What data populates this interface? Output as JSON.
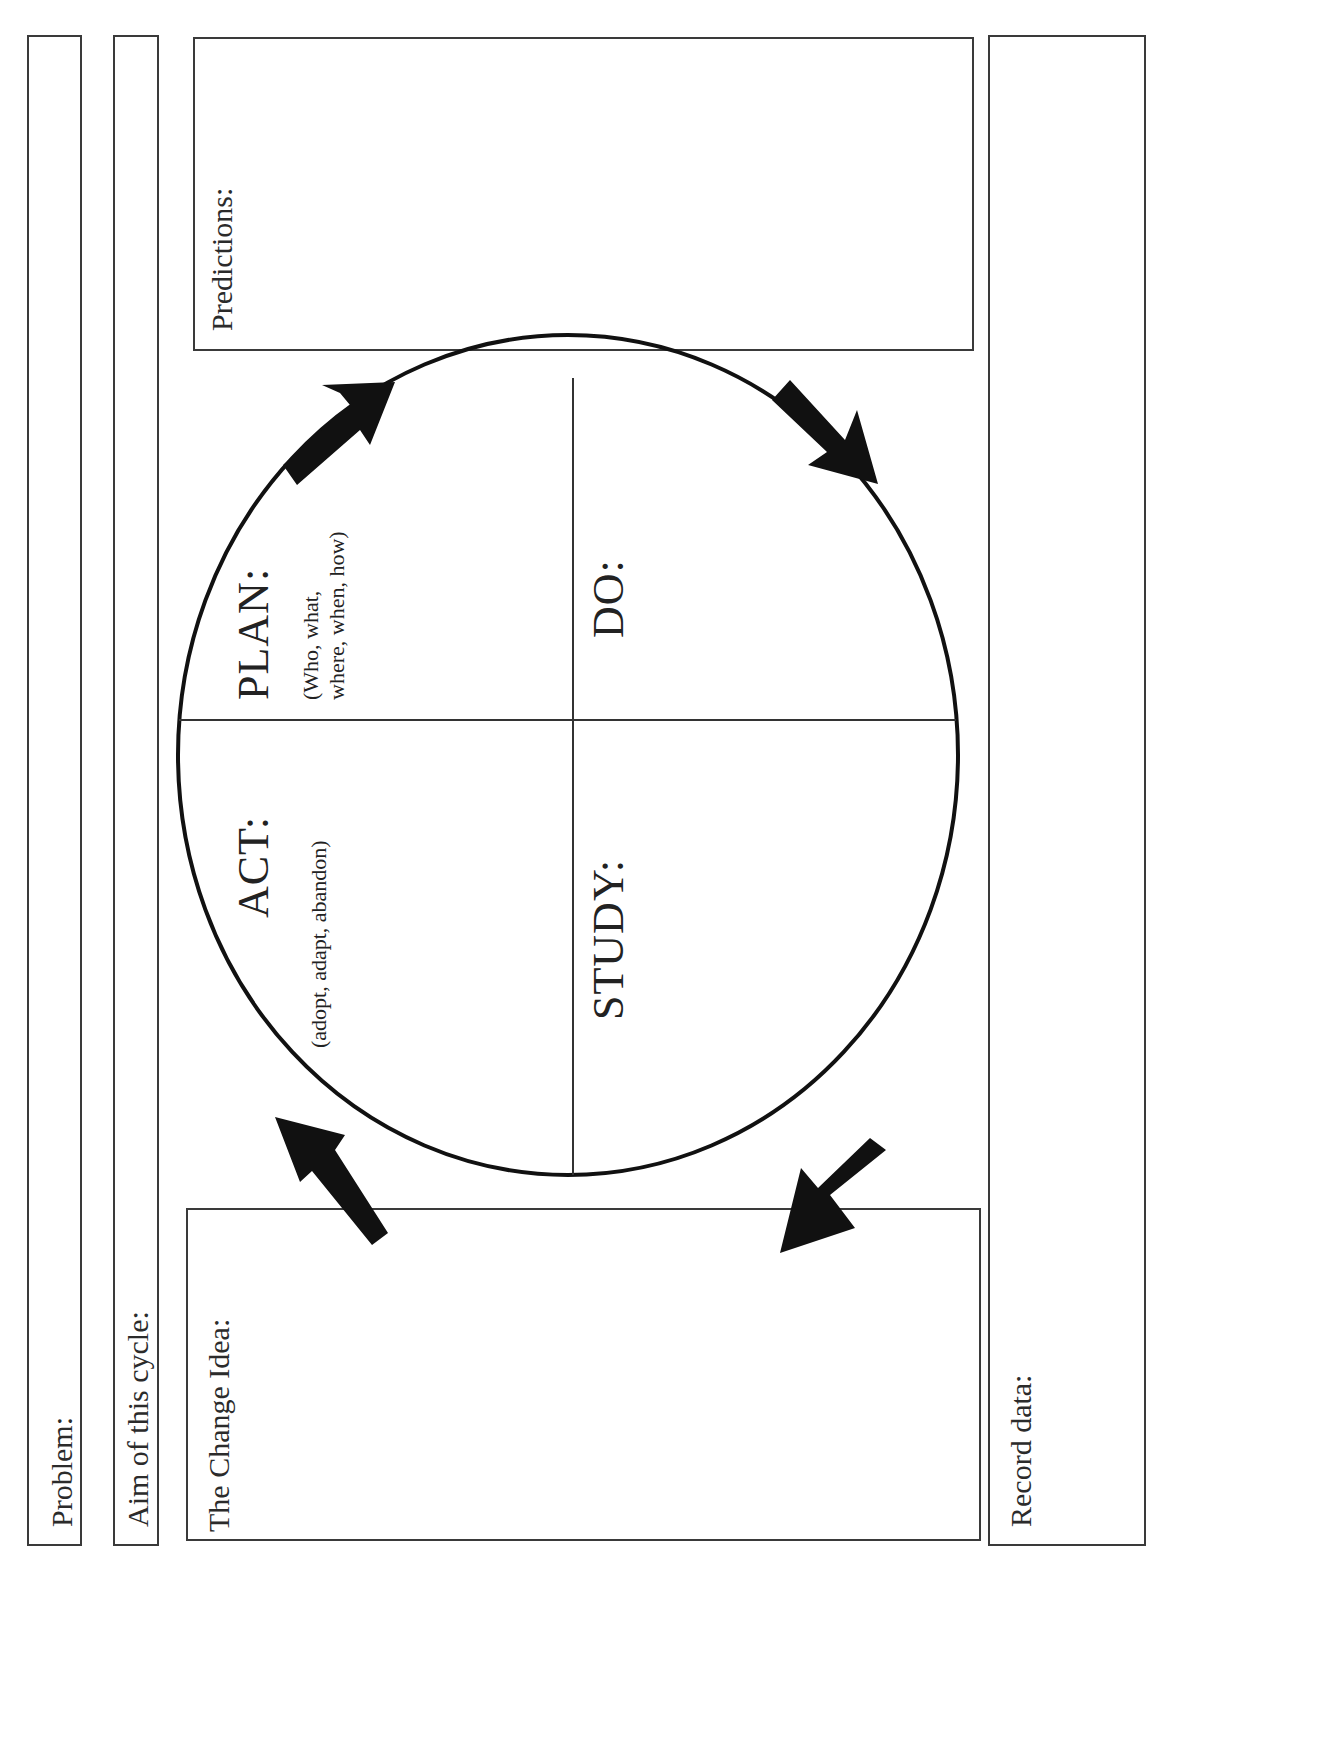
{
  "worksheet": {
    "problem_label": "Problem:",
    "aim_label": "Aim of this cycle:",
    "change_idea_label": "The Change Idea:",
    "predictions_label": "Predictions:",
    "record_data_label": "Record data:"
  },
  "cycle": {
    "plan": {
      "title": "PLAN:",
      "hint_line1": "(Who, what,",
      "hint_line2": "where, when, how)"
    },
    "do": {
      "title": "DO:"
    },
    "study": {
      "title": "STUDY:"
    },
    "act": {
      "title": "ACT:",
      "hint": "(adopt, adapt, abandon)"
    },
    "arrows": [
      "arrow-act-to-plan",
      "arrow-plan-to-do",
      "arrow-do-to-study",
      "arrow-study-to-act"
    ],
    "colors": {
      "line": "#111111",
      "box_border": "#3a3a3a"
    }
  }
}
